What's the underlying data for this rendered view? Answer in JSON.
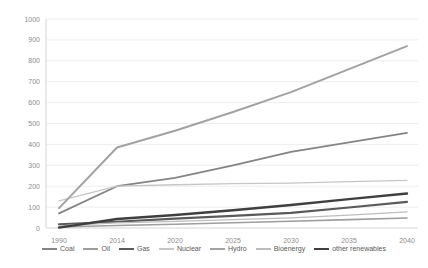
{
  "chart_data": {
    "type": "line",
    "title": "",
    "xlabel": "",
    "ylabel": "",
    "x_categories": [
      "1990",
      "2014",
      "2020",
      "2025",
      "2030",
      "2035",
      "2040"
    ],
    "y_tick_labels": [
      "0",
      "100",
      "200",
      "300",
      "400",
      "500",
      "600",
      "700",
      "800",
      "900",
      "1000"
    ],
    "ylim": [
      0,
      1000
    ],
    "y_tick_step": 100,
    "grid": "horizontal-light",
    "legend_position": "bottom",
    "axis_label_color": "#8c8c8c",
    "gridline_color": "#ededed",
    "axis_line_color": "#d6d6d6",
    "series": [
      {
        "name": "Coal",
        "color": "#848484",
        "width": 1.8,
        "values": [
          70,
          200,
          240,
          300,
          364,
          410,
          455
        ]
      },
      {
        "name": "Oil",
        "color": "#9e9e9e",
        "width": 1.6,
        "values": [
          5,
          12,
          18,
          25,
          32,
          40,
          48
        ]
      },
      {
        "name": "Gas",
        "color": "#5a5a5a",
        "width": 2.2,
        "values": [
          18,
          30,
          45,
          58,
          72,
          98,
          125
        ]
      },
      {
        "name": "Nuclear",
        "color": "#c6c6c6",
        "width": 1.3,
        "values": [
          130,
          200,
          207,
          212,
          215,
          222,
          228
        ]
      },
      {
        "name": "Hydro",
        "color": "#a2a2a2",
        "width": 2.0,
        "values": [
          95,
          385,
          465,
          555,
          650,
          760,
          870
        ]
      },
      {
        "name": "Bioenergy",
        "color": "#bdbdbd",
        "width": 1.3,
        "values": [
          10,
          25,
          32,
          40,
          48,
          62,
          77
        ]
      },
      {
        "name": "other renewables",
        "color": "#3f3f3f",
        "width": 2.4,
        "values": [
          2,
          43,
          62,
          85,
          110,
          138,
          165
        ]
      }
    ]
  }
}
